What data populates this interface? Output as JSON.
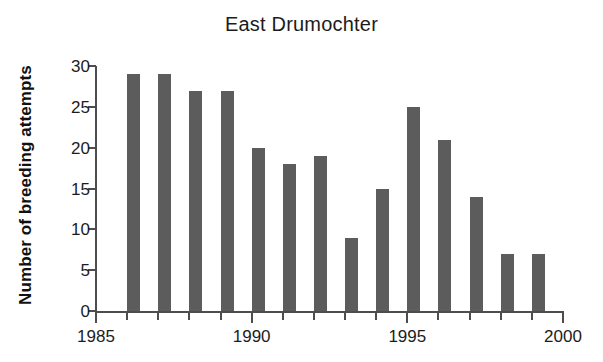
{
  "chart_data": {
    "type": "bar",
    "title": "East Drumochter",
    "xlabel": "",
    "ylabel": "Number of breeding attempts",
    "categories": [
      1986,
      1987,
      1988,
      1989,
      1990,
      1991,
      1992,
      1993,
      1994,
      1995,
      1996,
      1997,
      1998,
      1999
    ],
    "values": [
      29,
      29,
      27,
      27,
      20,
      18,
      19,
      9,
      15,
      25,
      21,
      14,
      7,
      7
    ],
    "xlim": [
      1985,
      2000
    ],
    "ylim": [
      0,
      30
    ],
    "ytick_labels": [
      "0",
      "5",
      "10",
      "15",
      "20",
      "25",
      "30"
    ],
    "ytick_values": [
      0,
      5,
      10,
      15,
      20,
      25,
      30
    ],
    "xtick_major_labels": [
      "1985",
      "1990",
      "1995",
      "2000"
    ],
    "xtick_major_values": [
      1985,
      1990,
      1995,
      2000
    ],
    "xtick_minor_values": [
      1986,
      1987,
      1988,
      1989,
      1991,
      1992,
      1993,
      1994,
      1996,
      1997,
      1998,
      1999
    ],
    "grid": false,
    "legend": false,
    "bar_color": "#5c5c5c",
    "axis_color": "#4d4d4d",
    "background_color": "#ffffff"
  }
}
